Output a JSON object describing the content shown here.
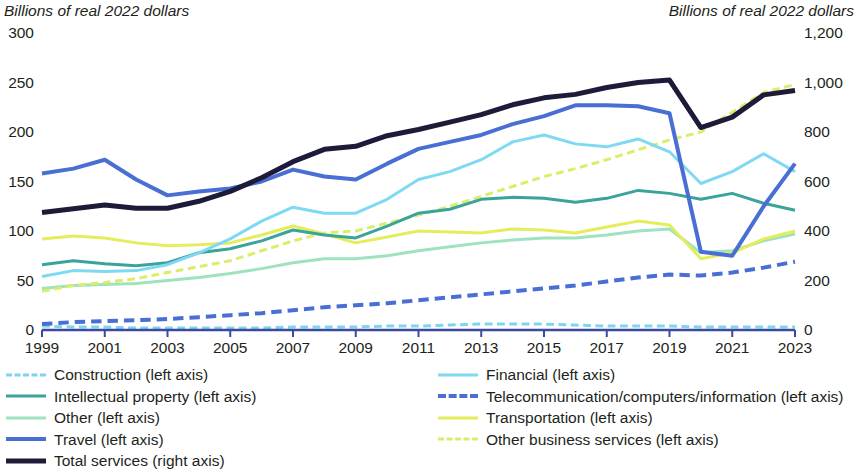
{
  "axes": {
    "left_title": "Billions of real 2022 dollars",
    "right_title": "Billions of real 2022 dollars",
    "left_ticks": [
      "300",
      "250",
      "200",
      "150",
      "100",
      "50",
      "0"
    ],
    "right_ticks": [
      "1,200",
      "1,000",
      "800",
      "600",
      "400",
      "200",
      "0"
    ],
    "x_ticks": [
      "1999",
      "2001",
      "2003",
      "2005",
      "2007",
      "2009",
      "2011",
      "2013",
      "2015",
      "2017",
      "2019",
      "2021",
      "2023"
    ]
  },
  "legend": {
    "left_column": [
      {
        "label": "Construction (left axis)",
        "color": "#7fd4f0",
        "dash": "dashed",
        "width": 3
      },
      {
        "label": "Intellectual property (left axis)",
        "color": "#3aa39a",
        "dash": "solid",
        "width": 3
      },
      {
        "label": "Other (left axis)",
        "color": "#9fe2bf",
        "dash": "solid",
        "width": 3
      },
      {
        "label": "Travel (left axis)",
        "color": "#4a6fd4",
        "dash": "solid",
        "width": 4
      },
      {
        "label": "Total services (right axis)",
        "color": "#1c1c3a",
        "dash": "solid",
        "width": 5
      }
    ],
    "right_column": [
      {
        "label": "Financial (left axis)",
        "color": "#7fd9f2",
        "dash": "solid",
        "width": 3
      },
      {
        "label": "Telecommunication/computers/information (left axis)",
        "color": "#4a6fd4",
        "dash": "dashed",
        "width": 4
      },
      {
        "label": "Transportation (left axis)",
        "color": "#e4ed5c",
        "dash": "solid",
        "width": 3
      },
      {
        "label": "Other business services (left axis)",
        "color": "#dced6a",
        "dash": "dashed",
        "width": 3
      }
    ]
  },
  "chart_data": {
    "type": "line",
    "title": "",
    "xlabel": "",
    "ylabel": "Billions of real 2022 dollars",
    "ylabel_right": "Billions of real 2022 dollars",
    "x": [
      1999,
      2000,
      2001,
      2002,
      2003,
      2004,
      2005,
      2006,
      2007,
      2008,
      2009,
      2010,
      2011,
      2012,
      2013,
      2014,
      2015,
      2016,
      2017,
      2018,
      2019,
      2020,
      2021,
      2022,
      2023
    ],
    "xlim": [
      1999,
      2023
    ],
    "ylim_left": [
      0,
      300
    ],
    "ylim_right": [
      0,
      1200
    ],
    "grid": false,
    "legend_position": "below",
    "series": [
      {
        "name": "Total services (right axis)",
        "axis": "right",
        "color": "#1c1c3a",
        "dash": "solid",
        "width": 5,
        "values": [
          475,
          490,
          505,
          492,
          492,
          520,
          560,
          615,
          680,
          730,
          742,
          785,
          810,
          840,
          870,
          910,
          938,
          952,
          980,
          1000,
          1010,
          818,
          860,
          950,
          968
        ]
      },
      {
        "name": "Travel (left axis)",
        "axis": "left",
        "color": "#4a6fd4",
        "dash": "solid",
        "width": 4,
        "values": [
          158,
          163,
          172,
          152,
          136,
          140,
          143,
          150,
          162,
          155,
          152,
          168,
          183,
          190,
          197,
          208,
          216,
          227,
          227,
          226,
          219,
          79,
          75,
          125,
          168
        ]
      },
      {
        "name": "Financial (left axis)",
        "axis": "left",
        "color": "#7fd9f2",
        "dash": "solid",
        "width": 3,
        "values": [
          54,
          60,
          59,
          60,
          66,
          78,
          92,
          110,
          124,
          118,
          118,
          132,
          152,
          160,
          172,
          190,
          197,
          188,
          185,
          193,
          180,
          148,
          160,
          178,
          160
        ]
      },
      {
        "name": "Intellectual property (left axis)",
        "axis": "left",
        "color": "#3aa39a",
        "dash": "solid",
        "width": 3,
        "values": [
          66,
          70,
          67,
          65,
          68,
          78,
          82,
          90,
          101,
          96,
          93,
          105,
          118,
          122,
          132,
          134,
          133,
          129,
          133,
          141,
          138,
          132,
          138,
          128,
          121
        ]
      },
      {
        "name": "Other business services (left axis)",
        "axis": "left",
        "color": "#dced6a",
        "dash": "dashed",
        "width": 3,
        "values": [
          39,
          45,
          48,
          52,
          58,
          64,
          70,
          80,
          90,
          98,
          100,
          108,
          116,
          125,
          135,
          145,
          155,
          163,
          172,
          182,
          192,
          200,
          220,
          240,
          248
        ]
      },
      {
        "name": "Transportation (left axis)",
        "axis": "left",
        "color": "#e4ed5c",
        "dash": "solid",
        "width": 3,
        "values": [
          92,
          95,
          93,
          88,
          85,
          86,
          88,
          96,
          105,
          97,
          88,
          94,
          100,
          99,
          98,
          102,
          101,
          98,
          104,
          110,
          106,
          72,
          78,
          92,
          100
        ]
      },
      {
        "name": "Other (left axis)",
        "axis": "left",
        "color": "#9fe2bf",
        "dash": "solid",
        "width": 3,
        "values": [
          42,
          45,
          46,
          47,
          50,
          53,
          57,
          62,
          68,
          72,
          72,
          75,
          80,
          84,
          88,
          91,
          93,
          93,
          96,
          100,
          102,
          78,
          80,
          90,
          97
        ]
      },
      {
        "name": "Telecommunication/computers/information (left axis)",
        "axis": "left",
        "color": "#4a6fd4",
        "dash": "dashed",
        "width": 4,
        "values": [
          6,
          8,
          9,
          10,
          11,
          13,
          15,
          17,
          20,
          23,
          25,
          27,
          30,
          33,
          36,
          39,
          42,
          45,
          49,
          53,
          56,
          55,
          58,
          63,
          69
        ]
      },
      {
        "name": "Construction (left axis)",
        "axis": "left",
        "color": "#7fd4f0",
        "dash": "dashed",
        "width": 3,
        "values": [
          4,
          3,
          3,
          2,
          2,
          2,
          2,
          2,
          3,
          3,
          3,
          4,
          4,
          5,
          6,
          6,
          6,
          5,
          4,
          4,
          4,
          3,
          3,
          3,
          3
        ]
      }
    ]
  }
}
